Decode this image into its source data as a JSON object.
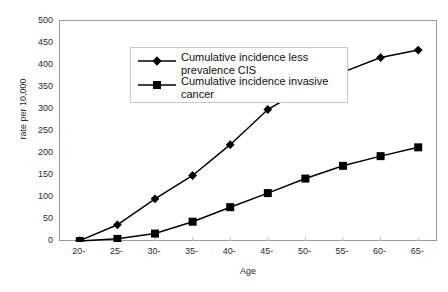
{
  "chart_data": {
    "type": "line",
    "title": "",
    "xlabel": "Age",
    "ylabel": "rate per 10,000",
    "categories": [
      "20-",
      "25-",
      "30-",
      "35-",
      "40-",
      "45-",
      "50-",
      "55-",
      "60-",
      "65-"
    ],
    "ylim": [
      0,
      500
    ],
    "ytick_values": [
      0,
      50,
      100,
      150,
      200,
      250,
      300,
      350,
      400,
      450,
      500
    ],
    "ytick_labels": [
      "0",
      "50",
      "100",
      "150",
      "200",
      "250",
      "300",
      "350",
      "400",
      "450",
      "500"
    ],
    "grid": false,
    "legend_position": "upper-left-inside",
    "series": [
      {
        "name": "Cumulative incidence less prevalence CIS",
        "marker": "diamond",
        "color": "#000000",
        "values": [
          2,
          38,
          97,
          150,
          220,
          300,
          350,
          385,
          418,
          435
        ]
      },
      {
        "name": "Cumulative incidence invasive cancer",
        "marker": "square",
        "color": "#000000",
        "values": [
          1,
          6,
          18,
          45,
          78,
          110,
          143,
          172,
          194,
          214
        ]
      }
    ]
  },
  "legend": {
    "entries": [
      {
        "label": "Cumulative incidence less\nprevalence CIS",
        "marker": "diamond"
      },
      {
        "label": "Cumulative incidence invasive\ncancer",
        "marker": "square"
      }
    ]
  },
  "axes": {
    "y_title": "rate per 10,000",
    "x_title": "Age"
  }
}
